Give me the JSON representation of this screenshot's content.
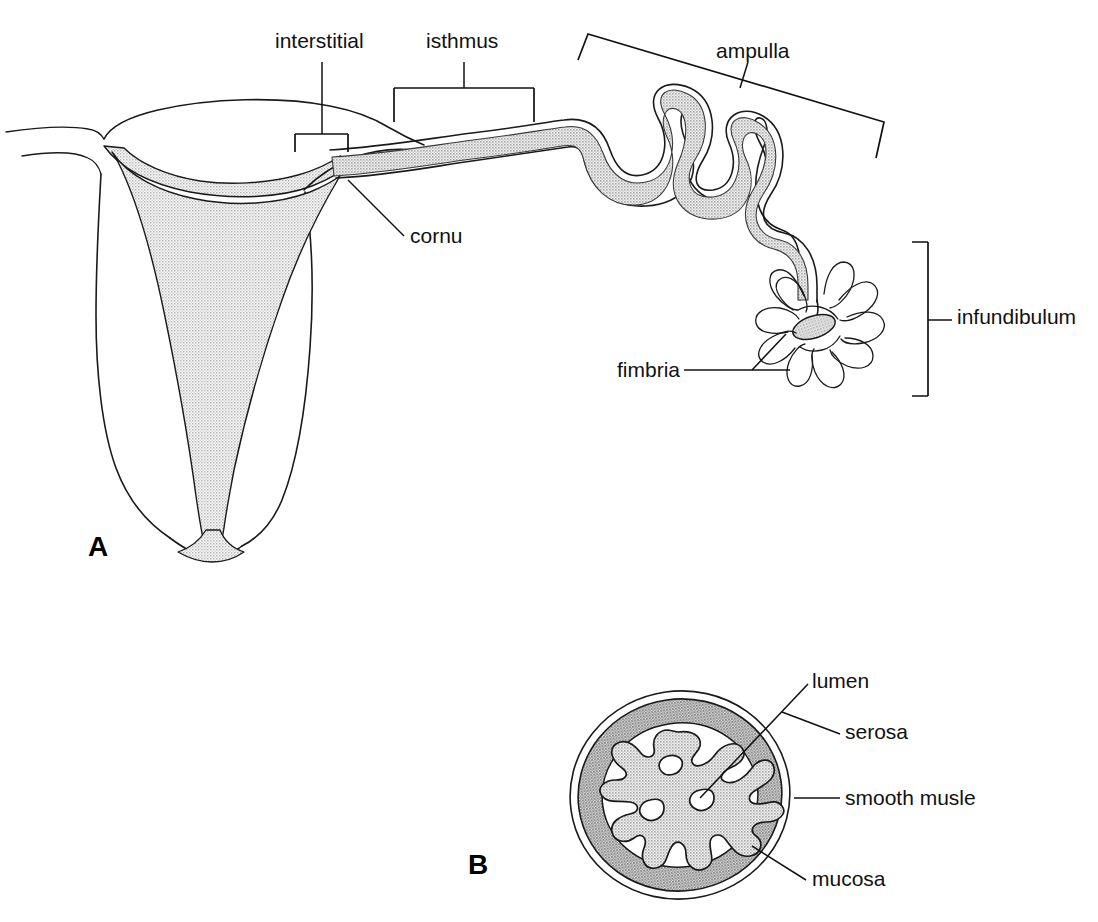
{
  "figure": {
    "background_color": "#ffffff",
    "line_color": "#1a1a1a",
    "stipple_light": "#c9c9c9",
    "stipple_dark": "#9a9a9a"
  },
  "panels": [
    {
      "letter": "A",
      "name": "panel-a",
      "description": "Dorsal view of uterine horn, oviduct and infundibulum",
      "letter_position": {
        "x": 88,
        "y": 556
      }
    },
    {
      "letter": "B",
      "name": "panel-b",
      "description": "Transverse cross-section of the oviduct",
      "letter_position": {
        "x": 468,
        "y": 874
      }
    }
  ],
  "panel_a_labels": [
    {
      "id": "interstitial",
      "text": "interstitial",
      "x": 275,
      "y": 48,
      "anchor": "start",
      "pointer": "bracket",
      "name": "label-interstitial"
    },
    {
      "id": "isthmus",
      "text": "isthmus",
      "x": 426,
      "y": 48,
      "anchor": "start",
      "pointer": "bracket",
      "name": "label-isthmus"
    },
    {
      "id": "ampulla",
      "text": "ampulla",
      "x": 716,
      "y": 58,
      "anchor": "start",
      "pointer": "bracket-tilted",
      "name": "label-ampulla"
    },
    {
      "id": "cornu",
      "text": "cornu",
      "x": 410,
      "y": 243,
      "anchor": "start",
      "pointer": "leader-line",
      "name": "label-cornu"
    },
    {
      "id": "infundibulum",
      "text": "infundibulum",
      "x": 957,
      "y": 324,
      "anchor": "start",
      "pointer": "bracket",
      "name": "label-infundibulum"
    },
    {
      "id": "fimbria",
      "text": "fimbria",
      "x": 617,
      "y": 375,
      "anchor": "start",
      "pointer": "leader-line",
      "name": "label-fimbria"
    }
  ],
  "panel_b_labels": [
    {
      "id": "lumen",
      "text": "lumen",
      "x": 812,
      "y": 688,
      "anchor": "start",
      "name": "label-lumen"
    },
    {
      "id": "serosa",
      "text": "serosa",
      "x": 845,
      "y": 739,
      "anchor": "start",
      "name": "label-serosa"
    },
    {
      "id": "smooth_musle",
      "text": "smooth musle",
      "x": 845,
      "y": 804,
      "anchor": "start",
      "name": "label-smooth-muscle"
    },
    {
      "id": "mucosa",
      "text": "mucosa",
      "x": 812,
      "y": 884,
      "anchor": "start",
      "name": "label-mucosa"
    }
  ]
}
